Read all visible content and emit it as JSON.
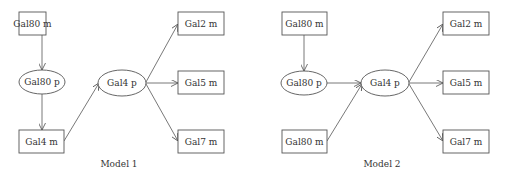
{
  "colors": {
    "stroke": "#555555",
    "text": "#333333",
    "background": "#ffffff"
  },
  "models": [
    {
      "caption": "Model 1",
      "caption_pos": [
        119,
        167
      ],
      "nodes": [
        {
          "id": "m1-gal80m",
          "label": "Gal80 m",
          "shape": "rect",
          "x": 19,
          "y": 12,
          "w": 27,
          "h": 23
        },
        {
          "id": "m1-gal80p",
          "label": "Gal80 p",
          "shape": "ellipse",
          "cx": 42,
          "cy": 82,
          "rx": 23,
          "ry": 12
        },
        {
          "id": "m1-gal4m",
          "label": "Gal4 m",
          "shape": "rect",
          "x": 19,
          "y": 130,
          "w": 45,
          "h": 23
        },
        {
          "id": "m1-gal4p",
          "label": "Gal4 p",
          "shape": "ellipse",
          "cx": 122,
          "cy": 83,
          "rx": 24,
          "ry": 13
        },
        {
          "id": "m1-gal2m",
          "label": "Gal2 m",
          "shape": "rect",
          "x": 178,
          "y": 12,
          "w": 46,
          "h": 23
        },
        {
          "id": "m1-gal5m",
          "label": "Gal5 m",
          "shape": "rect",
          "x": 178,
          "y": 71,
          "w": 46,
          "h": 23
        },
        {
          "id": "m1-gal7m",
          "label": "Gal7 m",
          "shape": "rect",
          "x": 178,
          "y": 130,
          "w": 46,
          "h": 23
        }
      ],
      "edges": [
        {
          "from": "m1-gal80m",
          "to": "m1-gal80p",
          "x1": 42,
          "y1": 35,
          "x2": 42,
          "y2": 70
        },
        {
          "from": "m1-gal80p",
          "to": "m1-gal4m",
          "x1": 42,
          "y1": 94,
          "x2": 42,
          "y2": 130
        },
        {
          "from": "m1-gal4m",
          "to": "m1-gal4p",
          "x1": 64,
          "y1": 141,
          "x2": 99,
          "y2": 83
        },
        {
          "from": "m1-gal4p",
          "to": "m1-gal2m",
          "x1": 146,
          "y1": 82,
          "x2": 178,
          "y2": 24
        },
        {
          "from": "m1-gal4p",
          "to": "m1-gal5m",
          "x1": 146,
          "y1": 83,
          "x2": 178,
          "y2": 83
        },
        {
          "from": "m1-gal4p",
          "to": "m1-gal7m",
          "x1": 146,
          "y1": 84,
          "x2": 178,
          "y2": 141
        }
      ]
    },
    {
      "caption": "Model 2",
      "caption_pos": [
        382,
        167
      ],
      "nodes": [
        {
          "id": "m2-gal80m-top",
          "label": "Gal80 m",
          "shape": "rect",
          "x": 282,
          "y": 12,
          "w": 45,
          "h": 23
        },
        {
          "id": "m2-gal80p",
          "label": "Gal80 p",
          "shape": "ellipse",
          "cx": 304,
          "cy": 83,
          "rx": 23,
          "ry": 12
        },
        {
          "id": "m2-gal80m-bottom",
          "label": "Gal80 m",
          "shape": "rect",
          "x": 282,
          "y": 130,
          "w": 45,
          "h": 23
        },
        {
          "id": "m2-gal4p",
          "label": "Gal4 p",
          "shape": "ellipse",
          "cx": 385,
          "cy": 83,
          "rx": 24,
          "ry": 13
        },
        {
          "id": "m2-gal2m",
          "label": "Gal2 m",
          "shape": "rect",
          "x": 443,
          "y": 12,
          "w": 46,
          "h": 23
        },
        {
          "id": "m2-gal5m",
          "label": "Gal5 m",
          "shape": "rect",
          "x": 443,
          "y": 71,
          "w": 46,
          "h": 23
        },
        {
          "id": "m2-gal7m",
          "label": "Gal7 m",
          "shape": "rect",
          "x": 443,
          "y": 130,
          "w": 46,
          "h": 23
        }
      ],
      "edges": [
        {
          "from": "m2-gal80m-top",
          "to": "m2-gal80p",
          "x1": 304,
          "y1": 35,
          "x2": 304,
          "y2": 71
        },
        {
          "from": "m2-gal80p",
          "to": "m2-gal4p",
          "x1": 327,
          "y1": 83,
          "x2": 361,
          "y2": 83
        },
        {
          "from": "m2-gal80m-bottom",
          "to": "m2-gal4p",
          "x1": 327,
          "y1": 141,
          "x2": 362,
          "y2": 84
        },
        {
          "from": "m2-gal4p",
          "to": "m2-gal2m",
          "x1": 409,
          "y1": 82,
          "x2": 443,
          "y2": 24
        },
        {
          "from": "m2-gal4p",
          "to": "m2-gal5m",
          "x1": 409,
          "y1": 83,
          "x2": 443,
          "y2": 83
        },
        {
          "from": "m2-gal4p",
          "to": "m2-gal7m",
          "x1": 409,
          "y1": 84,
          "x2": 443,
          "y2": 141
        }
      ]
    }
  ]
}
